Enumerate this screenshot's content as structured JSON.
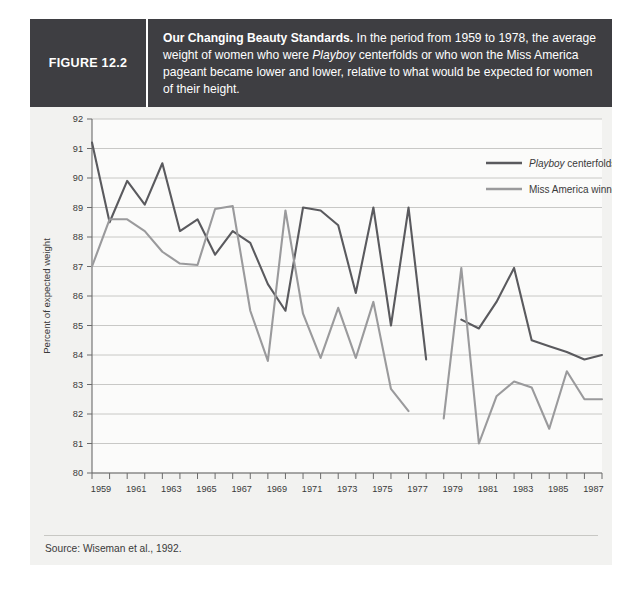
{
  "figure": {
    "number_label": "FIGURE 12.2",
    "caption_lead": "Our Changing Beauty Standards.",
    "caption_part1": " In the period from 1959 to 1978, the average weight of women who were ",
    "caption_italic": "Playboy",
    "caption_part2": " centerfolds or who won the Miss America pageant became lower and lower, relative to what would be expected for women of their height.",
    "source": "Source: Wiseman et al., 1992."
  },
  "colors": {
    "header_bg": "#3e3e42",
    "card_bg": "#f2f2f0",
    "playboy_line": "#5a5a5e",
    "miss_america_line": "#9a9a9c",
    "gridline": "#c2c2c0",
    "axis": "#6b6b6b",
    "text": "#3a3a3a"
  },
  "chart_data": {
    "type": "line",
    "title": "Our Changing Beauty Standards",
    "xlabel": "",
    "ylabel": "Percent of expected weight",
    "ylim": [
      80,
      92
    ],
    "xlim": [
      1959,
      1988
    ],
    "ytick_step": 1,
    "yticks": [
      80,
      81,
      82,
      83,
      84,
      85,
      86,
      87,
      88,
      89,
      90,
      91,
      92
    ],
    "xticks_labeled": [
      1959,
      1961,
      1963,
      1965,
      1967,
      1969,
      1971,
      1973,
      1975,
      1977,
      1979,
      1981,
      1983,
      1985,
      1987
    ],
    "xticks_all": [
      1959,
      1960,
      1961,
      1962,
      1963,
      1964,
      1965,
      1966,
      1967,
      1968,
      1969,
      1970,
      1971,
      1972,
      1973,
      1974,
      1975,
      1976,
      1977,
      1978,
      1979,
      1980,
      1981,
      1982,
      1983,
      1984,
      1985,
      1986,
      1987,
      1988
    ],
    "grid": true,
    "legend_position": "top-right",
    "series": [
      {
        "name": "Playboy centerfolds",
        "name_italic_prefix": "Playboy",
        "name_rest": " centerfolds",
        "color": "#5a5a5e",
        "x": [
          1959,
          1960,
          1961,
          1962,
          1963,
          1964,
          1965,
          1966,
          1967,
          1968,
          1969,
          1970,
          1971,
          1972,
          1973,
          1974,
          1975,
          1976,
          1977,
          1978,
          1979,
          1980,
          1981,
          1982,
          1983,
          1984,
          1985,
          1986,
          1987,
          1988
        ],
        "values": [
          91.2,
          88.5,
          89.9,
          89.1,
          90.5,
          88.2,
          88.6,
          87.4,
          88.2,
          87.8,
          86.4,
          85.5,
          89.0,
          88.9,
          88.4,
          86.1,
          89.0,
          85.0,
          89.0,
          83.85,
          null,
          85.2,
          84.9,
          85.8,
          86.95,
          84.5,
          84.3,
          84.1,
          83.85,
          84.0
        ],
        "gap_after": 1978
      },
      {
        "name": "Miss America winners",
        "color": "#9a9a9c",
        "x": [
          1959,
          1960,
          1961,
          1962,
          1963,
          1964,
          1965,
          1966,
          1967,
          1968,
          1969,
          1970,
          1971,
          1972,
          1973,
          1974,
          1975,
          1976,
          1977,
          1978,
          1979,
          1980,
          1981,
          1982,
          1983,
          1984,
          1985,
          1986,
          1987,
          1988
        ],
        "values": [
          87.0,
          88.6,
          88.6,
          88.2,
          87.5,
          87.1,
          87.05,
          88.95,
          89.05,
          85.5,
          83.8,
          88.9,
          85.4,
          83.9,
          85.6,
          83.9,
          85.8,
          82.85,
          82.1,
          null,
          81.85,
          86.95,
          81.0,
          82.6,
          83.1,
          82.9,
          81.5,
          83.45,
          82.5,
          82.5
        ],
        "gap_after": 1977
      }
    ],
    "annotations": []
  }
}
